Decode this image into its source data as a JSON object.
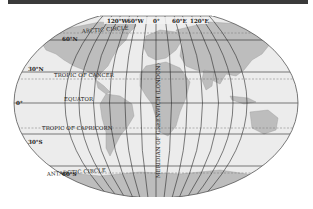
{
  "map": {
    "title": "World map projection with latitude and longitude lines",
    "projection": "Aitoff-style elliptical",
    "colors": {
      "ocean": "#ececec",
      "land": "#b9b9b9",
      "land_light": "#cfcfcf",
      "grid": "#2a2a2a",
      "dashed": "#777777",
      "topbar": "#3a3a3a"
    },
    "longitude_labels": [
      "120°W",
      "60°W",
      "0°",
      "60°E",
      "120°E"
    ],
    "latitude_labels": [
      "60°N",
      "30°N",
      "0°",
      "30°S",
      "60°S"
    ],
    "special_lines": {
      "arctic": "ARCTIC CIRCLE",
      "cancer": "TROPIC OF CANCER",
      "equator": "EQUATOR",
      "capricorn": "TROPIC OF CAPRICORN",
      "antarctic": "ANTARCTIC CIRCLE",
      "meridian": "MERIDIAN OF GREENWICH (LONDON)"
    }
  }
}
